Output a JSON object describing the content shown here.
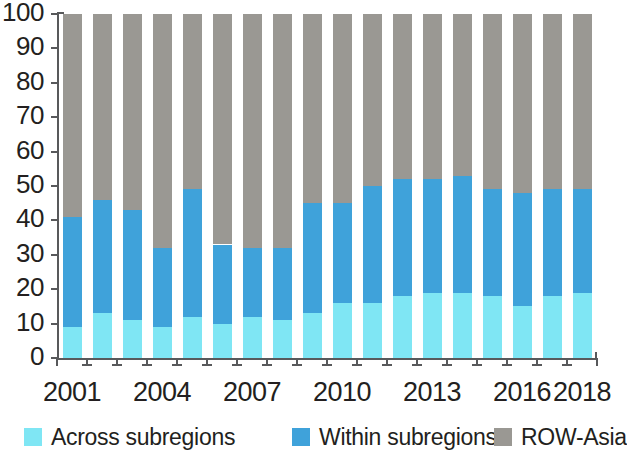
{
  "chart_data": {
    "type": "bar",
    "stacked": true,
    "title": "",
    "subtitle": "",
    "xlabel": "",
    "ylabel": "",
    "ylim": [
      0,
      100
    ],
    "yticks": [
      0,
      10,
      20,
      30,
      40,
      50,
      60,
      70,
      80,
      90,
      100
    ],
    "grid": false,
    "legend_position": "bottom",
    "categories": [
      "2001",
      "2002",
      "2003",
      "2004",
      "2005",
      "2006",
      "2007",
      "2008",
      "2009",
      "2010",
      "2011",
      "2012",
      "2013",
      "2014",
      "2015",
      "2016",
      "2017",
      "2018"
    ],
    "xtick_labels_shown": [
      "2001",
      "2004",
      "2007",
      "2010",
      "2013",
      "2016",
      "2018"
    ],
    "series": [
      {
        "name": "Across subregions",
        "color": "#7fe6f4",
        "values": [
          9,
          13,
          11,
          9,
          12,
          10,
          12,
          11,
          13,
          16,
          16,
          18,
          19,
          19,
          18,
          15,
          18,
          19
        ]
      },
      {
        "name": "Within subregions",
        "color": "#3fa2da",
        "values": [
          32,
          33,
          32,
          23,
          37,
          23,
          20,
          21,
          32,
          29,
          34,
          34,
          33,
          34,
          31,
          33,
          31,
          30
        ]
      },
      {
        "name": "ROW-Asia",
        "color": "#9a9893",
        "values": [
          59,
          54,
          57,
          68,
          51,
          67,
          68,
          68,
          55,
          55,
          50,
          48,
          48,
          47,
          51,
          52,
          51,
          51
        ]
      }
    ],
    "cumulative_tops": {
      "across": [
        9,
        13,
        11,
        9,
        12,
        10,
        12,
        11,
        13,
        16,
        16,
        18,
        19,
        19,
        18,
        15,
        18,
        19
      ],
      "across_plus_within": [
        41,
        46,
        43,
        32,
        49,
        33,
        32,
        32,
        45,
        45,
        50,
        52,
        52,
        53,
        49,
        48,
        49,
        49
      ],
      "total": [
        100,
        100,
        100,
        100,
        100,
        100,
        100,
        100,
        100,
        100,
        100,
        100,
        100,
        100,
        100,
        100,
        100,
        100
      ]
    }
  },
  "axis": {
    "y_labels": [
      "100",
      "90",
      "80",
      "70",
      "60",
      "50",
      "40",
      "30",
      "20",
      "10",
      "0"
    ],
    "x_labels": [
      "2001",
      "2004",
      "2007",
      "2010",
      "2013",
      "2016",
      "2018"
    ]
  },
  "legend": {
    "items": [
      {
        "label": "Across subregions",
        "color": "#7fe6f4"
      },
      {
        "label": "Within subregions",
        "color": "#3fa2da"
      },
      {
        "label": "ROW-Asia",
        "color": "#9a9893"
      }
    ]
  }
}
